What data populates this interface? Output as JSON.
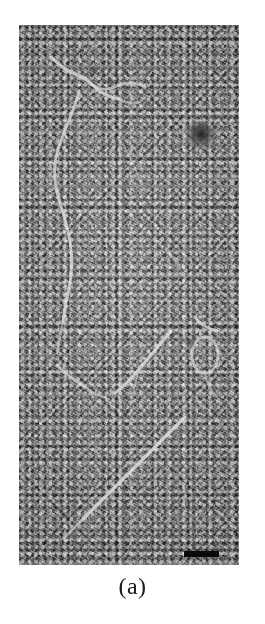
{
  "figure": {
    "panel_label": "(a)",
    "caption_text": "(a)",
    "image_type": "transmission-electron-micrograph",
    "background_color": "#ffffff",
    "micrograph": {
      "mean_gray": "#8d8d8d",
      "light_gray": "#d8d8d8",
      "dark_gray": "#3a3a3a",
      "frame": {
        "x": 19,
        "y": 25,
        "width": 220,
        "height": 540
      },
      "texture_description": "fine granular negative-stain background",
      "features": [
        {
          "name": "filament-upper-left",
          "kind": "bright-filament",
          "description": "short kinked bright filament near top-left"
        },
        {
          "name": "filament-left-curved",
          "kind": "bright-filament",
          "description": "long curved filament running down the left half"
        },
        {
          "name": "filament-lower-diagonal",
          "kind": "bright-filament",
          "description": "long diagonal filament from mid-right to lower-left corner"
        },
        {
          "name": "filament-mid-left-short",
          "kind": "bright-filament",
          "description": "short bright segment at mid-left"
        },
        {
          "name": "filament-right-loop",
          "kind": "bright-loop",
          "description": "small bright ring / loop structure at mid-right"
        },
        {
          "name": "dark-aggregate",
          "kind": "dark-blob",
          "description": "dark circular stain aggregate in upper right"
        }
      ],
      "scale_bar": {
        "name": "scale-bar",
        "color": "#0a0a0a",
        "position": "bottom-right",
        "x": 184,
        "y": 551,
        "width": 35,
        "height": 6,
        "label": ""
      }
    }
  }
}
